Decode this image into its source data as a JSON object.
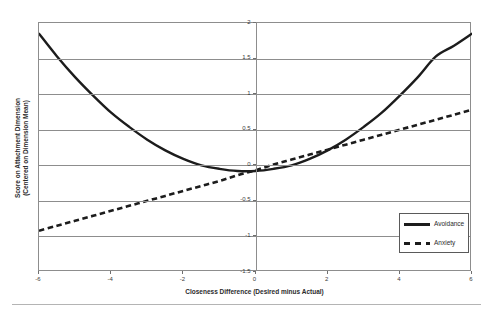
{
  "chart_data": {
    "type": "line",
    "title": "",
    "xlabel": "Closeness Difference (Desired minus Actual)",
    "ylabel": "Score on Attachment Dimension (Centered on Dimension Mean)",
    "ylabel_line1": "Score on Attachment Dimension",
    "ylabel_line2": "(Centered on Dimension Mean)",
    "xlim": [
      -6,
      6
    ],
    "ylim": [
      -1.5,
      2
    ],
    "xticks": [
      -6,
      -4,
      -2,
      0,
      2,
      4,
      6
    ],
    "xtick_labels": [
      "-6",
      "-4",
      "-2",
      "0",
      "2",
      "4",
      "6"
    ],
    "yticks": [
      2,
      1.5,
      1,
      0.5,
      0,
      -0.5,
      -1,
      -1.5
    ],
    "ytick_labels": [
      "2",
      "1.5",
      "1",
      "0.5",
      "0",
      "-0.5",
      "-1",
      "-1.5"
    ],
    "grid": "horizontal",
    "legend_position": "bottom-right",
    "x": [
      -6,
      -5.5,
      -5,
      -4.5,
      -4,
      -3.5,
      -3,
      -2.5,
      -2,
      -1.5,
      -1,
      -0.5,
      0,
      0.5,
      1,
      1.5,
      2,
      2.5,
      3,
      3.5,
      4,
      4.5,
      5,
      5.5,
      6
    ],
    "series": [
      {
        "name": "Avoidance",
        "style": "solid",
        "color": "#1c1c1c",
        "shape": "quadratic",
        "values": [
          1.85,
          1.53,
          1.24,
          0.98,
          0.74,
          0.54,
          0.36,
          0.21,
          0.09,
          0.0,
          -0.05,
          -0.08,
          -0.08,
          -0.05,
          0.0,
          0.09,
          0.21,
          0.36,
          0.54,
          0.74,
          0.98,
          1.24,
          1.53,
          1.68,
          1.85
        ]
      },
      {
        "name": "Anxiety",
        "style": "dashed",
        "color": "#1c1c1c",
        "shape": "linear",
        "values": [
          -0.92,
          -0.85,
          -0.78,
          -0.71,
          -0.64,
          -0.57,
          -0.5,
          -0.43,
          -0.36,
          -0.29,
          -0.22,
          -0.14,
          -0.07,
          0.01,
          0.08,
          0.15,
          0.22,
          0.29,
          0.36,
          0.43,
          0.5,
          0.57,
          0.64,
          0.71,
          0.78
        ]
      }
    ]
  },
  "legend": {
    "items": [
      {
        "label": "Avoidance",
        "style": "solid"
      },
      {
        "label": "Anxiety",
        "style": "dashed"
      }
    ]
  }
}
